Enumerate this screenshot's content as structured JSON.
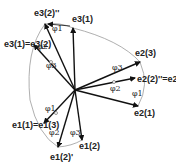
{
  "diagram": {
    "title": "",
    "center": {
      "x": 75,
      "y": 90
    },
    "arc_color": "#9a9a9a",
    "vector_color": "#111111",
    "vectors": [
      {
        "id": "e3_1",
        "base": "e",
        "sub": "3",
        "sup": "(1)",
        "tip": [
          73,
          28
        ],
        "label_pos": [
          70,
          22
        ]
      },
      {
        "id": "e3_2pp",
        "base": "e",
        "sub": "3",
        "sup": "(2)''",
        "tip": [
          45,
          24
        ],
        "label_pos": [
          36,
          17
        ]
      },
      {
        "id": "e3_1_eq_e3_2",
        "base": "e",
        "sub": "3",
        "sup": "(1)",
        "tip": [
          34,
          45
        ],
        "label_pos": [
          9,
          44
        ],
        "equals": "e3(2)",
        "label": "e3(1)=e3(2)"
      },
      {
        "id": "e2_3",
        "base": "e",
        "sub": "2",
        "sup": "(3)",
        "tip": [
          140,
          62
        ],
        "label_pos": [
          136,
          56
        ]
      },
      {
        "id": "e2_2pp_eq_e2_2p",
        "base": "e",
        "sub": "2",
        "sup": "(2)''",
        "tip": [
          135,
          78
        ],
        "label_pos": [
          140,
          80
        ],
        "label": "e2(2)''=e2(2)'"
      },
      {
        "id": "e2_1",
        "base": "e",
        "sub": "2",
        "sup": "(1)",
        "tip": [
          138,
          106
        ],
        "label_pos": [
          134,
          113
        ]
      },
      {
        "id": "e1_1_eq_e1_3",
        "base": "e",
        "sub": "1",
        "sup": "(1)",
        "tip": [
          44,
          123
        ],
        "label_pos": [
          16,
          127
        ],
        "label": "e1(1)=e1(3)"
      },
      {
        "id": "e1_2p",
        "base": "e",
        "sub": "1",
        "sup": "(2)'",
        "tip": [
          58,
          147
        ],
        "label_pos": [
          52,
          158
        ]
      },
      {
        "id": "e1_2",
        "base": "e",
        "sub": "1",
        "sup": "(2)",
        "tip": [
          82,
          140
        ],
        "label_pos": [
          80,
          148
        ]
      }
    ],
    "angle_labels": [
      {
        "text": "φ1",
        "pos": [
          52,
          31
        ]
      },
      {
        "text": "φ2",
        "pos": [
          38,
          49
        ]
      },
      {
        "text": "φ3",
        "pos": [
          48,
          66
        ]
      },
      {
        "text": "φ3",
        "pos": [
          112,
          71
        ]
      },
      {
        "text": "φ2",
        "pos": [
          112,
          89
        ]
      },
      {
        "text": "φ1",
        "pos": [
          132,
          95
        ]
      },
      {
        "text": "φ1",
        "pos": [
          46,
          110
        ]
      },
      {
        "text": "φ2",
        "pos": [
          50,
          134
        ]
      },
      {
        "text": "φ3",
        "pos": [
          71,
          134
        ]
      }
    ],
    "label_strings": {
      "e3_1": "e3(1)",
      "e3_2pp": "e3(2)''",
      "e3_1_eq_e3_2": "e3(1)=e3(2)",
      "e2_3": "e2(3)",
      "e2_2pp_eq_e2_2p": "e2(2)''=e2(2)'",
      "e2_1": "e2(1)",
      "e1_1_eq_e1_3": "e1(1)=e1(3)",
      "e1_2p": "e1(2)'",
      "e1_2": "e1(2)"
    }
  }
}
